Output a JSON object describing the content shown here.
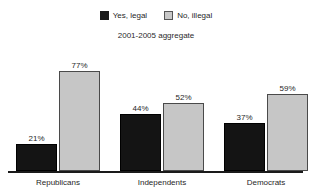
{
  "title": "",
  "legend": {
    "position": "top",
    "items": [
      {
        "label": "Yes, legal",
        "color": "#141414",
        "swatch": "dark"
      },
      {
        "label": "No, illegal",
        "color": "#c6c6c6",
        "swatch": "light"
      }
    ]
  },
  "subtitle": "2001-2005 aggregate",
  "chart_data": {
    "type": "bar",
    "title": "",
    "subtitle": "2001-2005 aggregate",
    "xlabel": "",
    "ylabel": "",
    "ylim": [
      0,
      100
    ],
    "grid": false,
    "legend_position": "top",
    "categories": [
      "Republicans",
      "Independents",
      "Democrats"
    ],
    "series": [
      {
        "name": "Yes, legal",
        "color": "#141414",
        "values": [
          21,
          44,
          37
        ],
        "labels": [
          "21%",
          "44%",
          "37%"
        ]
      },
      {
        "name": "No, illegal",
        "color": "#c6c6c6",
        "values": [
          77,
          52,
          59
        ],
        "labels": [
          "77%",
          "52%",
          "59%"
        ]
      }
    ]
  }
}
